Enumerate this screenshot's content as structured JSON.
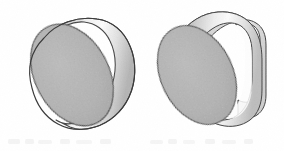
{
  "figure": {
    "kind": "technical-illustration",
    "background_color": "#ffffff",
    "outline_color": "#3a3a3a",
    "canvas": {
      "width": 284,
      "height": 151
    },
    "objects": [
      {
        "id": "left-cylinder",
        "name": "plain cylinder",
        "description": "Right circular cylinder shown in pictorial view with elliptical front face and curved lateral surface",
        "bounds": {
          "x": 17,
          "y": 17,
          "width": 116,
          "height": 117
        },
        "faces": [
          {
            "id": "front-ellipse",
            "name": "circular front face",
            "fill": "#b2b2b2",
            "stroke": "#3a3a3a"
          },
          {
            "id": "lateral-surface",
            "name": "curved lateral surface",
            "fill_light": "#fbfbfb",
            "fill_dark": "#b8b8b8",
            "stroke": "#3a3a3a"
          }
        ]
      },
      {
        "id": "right-cylinder-flats",
        "name": "cylinder with flats",
        "description": "Cylinder with flat top and bottom planes and a flat end face, shown in pictorial view",
        "bounds": {
          "x": 152,
          "y": 11,
          "width": 117,
          "height": 123
        },
        "faces": [
          {
            "id": "front-ellipse",
            "name": "circular front face",
            "fill": "#b2b2b2",
            "stroke": "#3a3a3a"
          },
          {
            "id": "top-flat",
            "name": "flat top plane",
            "fill": "#c9c9c9",
            "stroke": "#3a3a3a"
          },
          {
            "id": "lateral-surface",
            "name": "curved lateral surface",
            "fill_light": "#fcfcfc",
            "fill_dark": "#bcbcbc",
            "stroke": "#3a3a3a"
          },
          {
            "id": "end-face",
            "name": "flat end face",
            "fill": "#e6e6e6",
            "stroke": "#3a3a3a"
          }
        ]
      }
    ],
    "colors": {
      "face_gray": "#b2b2b2",
      "highlight": "#fdfdfd",
      "shadow_gray": "#a9a9a9",
      "outline": "#3a3a3a",
      "paper": "#ffffff",
      "bleed_through": "#ededed"
    },
    "artifacts": {
      "present": true,
      "description": "faint scanner bleed-through smudges along the lower edge of the page"
    }
  }
}
